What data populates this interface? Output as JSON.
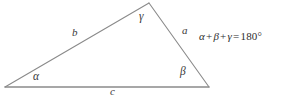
{
  "figure": {
    "background_color": "#ffffff",
    "stroke_color": "#8a8a8a",
    "text_color": "#3a3a3a"
  },
  "vertices": {
    "a_left": {
      "label": "α",
      "x": 5,
      "y": 87
    },
    "b_right": {
      "label": "β",
      "x": 209,
      "y": 87
    },
    "c_apex": {
      "label": "γ",
      "x": 149,
      "y": 3
    }
  },
  "angle_labels": [
    {
      "name": "alpha",
      "text": "α",
      "x": 33,
      "y": 71
    },
    {
      "name": "beta",
      "text": "β",
      "x": 180,
      "y": 66
    },
    {
      "name": "gamma",
      "text": "γ",
      "x": 139,
      "y": 11
    }
  ],
  "side_labels": [
    {
      "name": "side-a",
      "text": "a",
      "x": 182,
      "y": 25
    },
    {
      "name": "side-b",
      "text": "b",
      "x": 72,
      "y": 27
    },
    {
      "name": "side-c",
      "text": "c",
      "x": 110,
      "y": 86
    }
  ],
  "equation": {
    "alpha": "α",
    "plus_1": "+",
    "beta": "β",
    "plus_2": "+",
    "gamma": "γ",
    "equals": "=",
    "value": "180°",
    "full_text": "α + β + γ = 180°"
  }
}
